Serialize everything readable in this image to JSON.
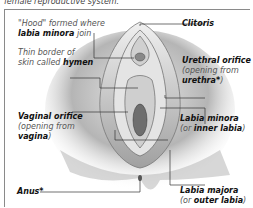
{
  "caption": "female reproductive system.",
  "labels": {
    "hood": {
      "line1": "\"Hood\" formed where",
      "bold": "labia minora",
      "tail": " join"
    },
    "hymen": {
      "line1": "Thin border of",
      "pre": "skin called ",
      "bold": "hymen"
    },
    "vaginal": {
      "title": "Vaginal orifice",
      "line2": "(opening from",
      "bold": "vagina",
      "tail": ")"
    },
    "anus": {
      "title": "Anus*"
    },
    "clitoris": {
      "title": "Clitoris"
    },
    "urethral": {
      "title": "Urethral orifice",
      "line2": "(opening from",
      "bold": "urethra*",
      "tail": ")"
    },
    "minora": {
      "title": "Labia minora",
      "pre": "(or ",
      "bold": "inner labia",
      "tail": ")"
    },
    "majora": {
      "title": "Labia majora",
      "pre": "(or ",
      "bold": "outer labia",
      "tail": ")"
    }
  },
  "colors": {
    "line": "#333333",
    "frame": "#8a8a8a",
    "shade": "#9a9a9a"
  }
}
